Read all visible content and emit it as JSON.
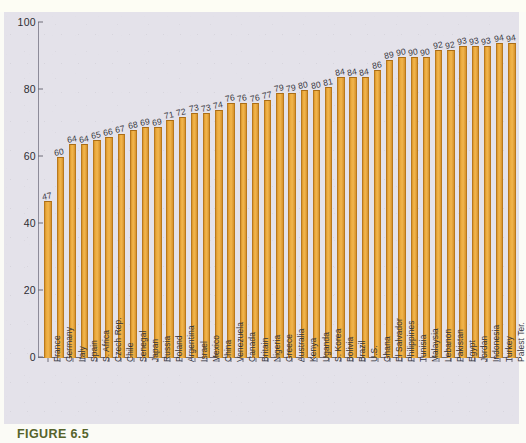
{
  "figure": {
    "caption": "FIGURE 6.5"
  },
  "colors": {
    "bar_fill": "#eeae41",
    "bar_edge": "#b9791d",
    "panel_background": "#e4e2ea",
    "page_background": "#fbfbf6",
    "caption": "#56632b",
    "axis": "#6e6c78",
    "text": "#33333b"
  },
  "chart_data": {
    "type": "bar",
    "title": "",
    "xlabel": "",
    "ylabel": "",
    "ylim": [
      0,
      100
    ],
    "yticks": [
      0,
      20,
      40,
      60,
      80,
      100
    ],
    "grid": false,
    "legend": "none",
    "orientation": "vertical",
    "sorted": "ascending",
    "categories": [
      "France",
      "Germany",
      "Italy",
      "Spain",
      "S. Africa",
      "Czech Rep.",
      "Chile",
      "Senegal",
      "Japan",
      "Russia",
      "Poland",
      "Argentina",
      "Israel",
      "Mexico",
      "China",
      "Venezuela",
      "Canada",
      "Britain",
      "Nigeria",
      "Greece",
      "Australia",
      "Kenya",
      "Uganda",
      "S. Korea",
      "Bolivia",
      "Brazil",
      "U.S.",
      "Ghana",
      "El Salvador",
      "Philippines",
      "Tunisia",
      "Malaysia",
      "Lebanon",
      "Pakistan",
      "Egypt",
      "Jordan",
      "Indonesia",
      "Turkey",
      "Palest Ter."
    ],
    "values": [
      47,
      60,
      64,
      64,
      65,
      66,
      67,
      68,
      69,
      69,
      71,
      72,
      73,
      73,
      74,
      76,
      76,
      76,
      77,
      79,
      79,
      80,
      80,
      81,
      84,
      84,
      84,
      86,
      89,
      90,
      90,
      90,
      92,
      92,
      93,
      93,
      93,
      94,
      94
    ]
  }
}
